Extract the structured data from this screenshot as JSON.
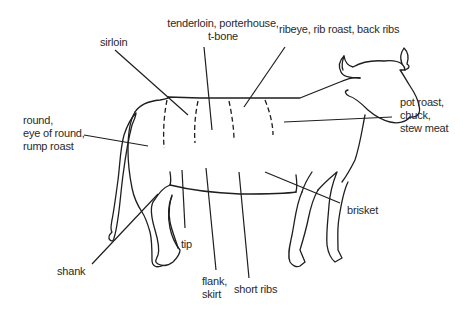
{
  "diagram": {
    "line_color": "#1e1e1e",
    "text_color": "#2a2a2a",
    "labels": {
      "sirloin": "sirloin",
      "tenderloin": "tenderloin, porterhouse,\nt-bone",
      "ribeye": "ribeye, rib roast, back ribs",
      "round": "round,\neye of round,\nrump roast",
      "chuck": "pot roast,\nchuck,\nstew meat",
      "brisket": "brisket",
      "tip": "tip",
      "shank": "shank",
      "flank": "flank,\nskirt",
      "short_ribs": "short ribs"
    }
  }
}
